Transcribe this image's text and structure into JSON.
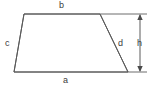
{
  "figure": {
    "type": "geometry-diagram",
    "background_color": "#ffffff",
    "stroke_color": "#5a5a5a",
    "label_color": "#3c3c3c",
    "canvas": {
      "width": 152,
      "height": 91
    },
    "shape": {
      "name": "trapezoid",
      "vertices": [
        {
          "name": "top-left",
          "x": 24,
          "y": 14
        },
        {
          "name": "top-right",
          "x": 100,
          "y": 14
        },
        {
          "name": "bottom-right",
          "x": 128,
          "y": 72
        },
        {
          "name": "bottom-left",
          "x": 14,
          "y": 72
        }
      ]
    },
    "labels": {
      "top_side": "b",
      "left_side": "c",
      "bottom_side": "a",
      "right_side": "d",
      "height": "h"
    },
    "dimension": {
      "name": "height-dimension",
      "label": "h",
      "arrow_x": 140,
      "top_y": 14,
      "bottom_y": 72,
      "extension_top": {
        "x1": 100,
        "y1": 14,
        "x2": 147,
        "y2": 14
      },
      "extension_bottom": {
        "x1": 128,
        "y1": 72,
        "x2": 147,
        "y2": 72
      }
    }
  }
}
